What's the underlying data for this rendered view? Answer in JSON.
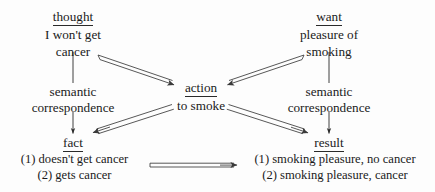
{
  "diagram": {
    "background_color": "#fdfdfd",
    "ink_color": "#1a1a1a",
    "nodes": {
      "thought": {
        "header": "thought",
        "line1": "I won't get",
        "line2": "cancer"
      },
      "want": {
        "header": "want",
        "line1": "pleasure of",
        "line2": "smoking"
      },
      "action": {
        "header": "action",
        "line1": "to smoke"
      },
      "fact": {
        "header": "fact",
        "item1": "(1) doesn't get cancer",
        "item2": "(2) gets cancer"
      },
      "result": {
        "header": "result",
        "item1": "(1) smoking pleasure, no cancer",
        "item2": "(2) smoking pleasure, cancer"
      }
    },
    "labels": {
      "left_semantic": "semantic",
      "left_correspondence": "correspondence",
      "right_semantic": "semantic",
      "right_correspondence": "correspondence"
    },
    "edges": [
      {
        "name": "thought-to-semantic-left",
        "style": "plain-line",
        "from": "thought",
        "to": "left_semantic"
      },
      {
        "name": "want-to-semantic-right",
        "style": "plain-line",
        "from": "want",
        "to": "right_semantic"
      },
      {
        "name": "thought-to-action",
        "style": "double-line-arrow",
        "from": "thought",
        "to": "action"
      },
      {
        "name": "want-to-action",
        "style": "double-line-arrow",
        "from": "want",
        "to": "action"
      },
      {
        "name": "action-to-fact",
        "style": "double-line-arrow",
        "from": "action",
        "to": "fact"
      },
      {
        "name": "action-to-result",
        "style": "double-line-arrow",
        "from": "action",
        "to": "result"
      },
      {
        "name": "correspondence-left-to-fact",
        "style": "single-line-arrow",
        "from": "left_correspondence",
        "to": "fact"
      },
      {
        "name": "correspondence-right-to-result",
        "style": "single-line-arrow",
        "from": "right_correspondence",
        "to": "result"
      },
      {
        "name": "fact-to-result",
        "style": "double-line-arrow",
        "from": "fact",
        "to": "result"
      }
    ]
  }
}
